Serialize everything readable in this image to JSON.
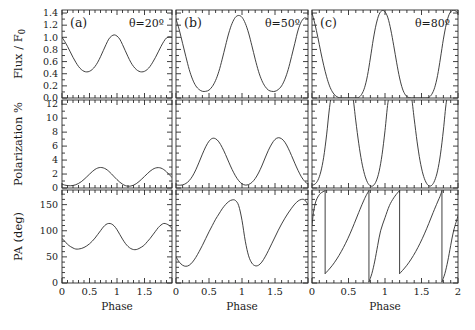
{
  "figure": {
    "panel_labels": [
      "(a)",
      "(b)",
      "(c)"
    ],
    "annotations": [
      "θ=20º",
      "θ=50º",
      "θ=80º"
    ],
    "row_labels": [
      "Flux / F",
      "Polarization %",
      "PA (deg)"
    ],
    "flux_label_main": "Flux / F",
    "flux_label_sub": "0",
    "polarization_label": "Polarization %",
    "pa_label": "PA (deg)",
    "xlabel": "Phase"
  },
  "axes": {
    "x_ticks": [
      0,
      0.5,
      1,
      1.5,
      2
    ],
    "x_ticklabels_col1": [
      "0",
      "0.5",
      "1",
      "1.5",
      ""
    ],
    "x_ticklabels_col2": [
      "0",
      "0.5",
      "1",
      "1.5",
      ""
    ],
    "x_ticklabels_col3": [
      "0",
      "0.5",
      "1",
      "1.5",
      "2"
    ],
    "xlim": [
      0,
      2
    ],
    "flux_ticks": [
      0.0,
      0.2,
      0.4,
      0.6,
      0.8,
      1.0,
      1.2,
      1.4
    ],
    "flux_ticklabels": [
      "0.0",
      "0.2",
      "0.4",
      "0.6",
      "0.8",
      "1.0",
      "1.2",
      "1.4"
    ],
    "flux_ylim": [
      0.0,
      1.45
    ],
    "pol_ticks": [
      0,
      2,
      4,
      6,
      8,
      10,
      12
    ],
    "pol_ticklabels": [
      "0",
      "2",
      "4",
      "6",
      "8",
      "10",
      "12"
    ],
    "pol_ylim": [
      0,
      12.6
    ],
    "pa_ticks": [
      0,
      50,
      100,
      150
    ],
    "pa_ticklabels": [
      "0",
      "50",
      "100",
      "150"
    ],
    "pa_ylim": [
      0,
      178
    ]
  },
  "chart_data": {
    "type": "line",
    "title": "",
    "xlabel": "Phase",
    "grid": false,
    "legend": "none",
    "panels": [
      {
        "row": "flux",
        "col": 0,
        "label": "(a)",
        "annotation": "θ=20º",
        "ylabel": "Flux / F0",
        "ylim": [
          0.0,
          1.45
        ],
        "xlim": [
          0,
          2
        ],
        "x": [
          0.0,
          0.05,
          0.1,
          0.15,
          0.2,
          0.25,
          0.3,
          0.35,
          0.4,
          0.45,
          0.5,
          0.55,
          0.6,
          0.65,
          0.7,
          0.75,
          0.8,
          0.85,
          0.9,
          0.95,
          1.0,
          1.05,
          1.1,
          1.15,
          1.2,
          1.25,
          1.3,
          1.35,
          1.4,
          1.45,
          1.5,
          1.55,
          1.6,
          1.65,
          1.7,
          1.75,
          1.8,
          1.85,
          1.9,
          1.95,
          2.0
        ],
        "y": [
          1.0,
          0.93,
          0.85,
          0.76,
          0.67,
          0.59,
          0.52,
          0.47,
          0.44,
          0.43,
          0.44,
          0.47,
          0.52,
          0.59,
          0.68,
          0.78,
          0.88,
          0.97,
          1.02,
          1.04,
          1.02,
          0.97,
          0.88,
          0.78,
          0.68,
          0.59,
          0.52,
          0.47,
          0.44,
          0.43,
          0.44,
          0.47,
          0.52,
          0.59,
          0.67,
          0.76,
          0.85,
          0.93,
          0.99,
          1.01,
          1.0
        ]
      },
      {
        "row": "flux",
        "col": 1,
        "label": "(b)",
        "annotation": "θ=50º",
        "ylabel": "Flux / F0",
        "ylim": [
          0.0,
          1.45
        ],
        "xlim": [
          0,
          2
        ],
        "x": [
          0.0,
          0.05,
          0.1,
          0.15,
          0.2,
          0.25,
          0.3,
          0.35,
          0.4,
          0.45,
          0.5,
          0.55,
          0.6,
          0.65,
          0.7,
          0.75,
          0.8,
          0.85,
          0.9,
          0.95,
          1.0,
          1.05,
          1.1,
          1.15,
          1.2,
          1.25,
          1.3,
          1.35,
          1.4,
          1.45,
          1.5,
          1.55,
          1.6,
          1.65,
          1.7,
          1.75,
          1.8,
          1.85,
          1.9,
          1.95,
          2.0
        ],
        "y": [
          1.3,
          1.12,
          0.9,
          0.68,
          0.47,
          0.31,
          0.2,
          0.14,
          0.11,
          0.11,
          0.13,
          0.19,
          0.29,
          0.44,
          0.64,
          0.86,
          1.07,
          1.23,
          1.33,
          1.36,
          1.33,
          1.23,
          1.07,
          0.86,
          0.64,
          0.44,
          0.29,
          0.19,
          0.13,
          0.11,
          0.11,
          0.14,
          0.2,
          0.31,
          0.47,
          0.68,
          0.9,
          1.12,
          1.26,
          1.32,
          1.3
        ]
      },
      {
        "row": "flux",
        "col": 2,
        "label": "(c)",
        "annotation": "θ=80º",
        "ylabel": "Flux / F0",
        "ylim": [
          0.0,
          1.45
        ],
        "xlim": [
          0,
          2
        ],
        "x": [
          0.0,
          0.04,
          0.08,
          0.12,
          0.16,
          0.2,
          0.24,
          0.28,
          0.32,
          0.36,
          0.4,
          0.44,
          0.48,
          0.52,
          0.56,
          0.6,
          0.64,
          0.68,
          0.72,
          0.76,
          0.8,
          0.84,
          0.88,
          0.92,
          0.96,
          1.0,
          1.04,
          1.08,
          1.12,
          1.16,
          1.2,
          1.24,
          1.28,
          1.32,
          1.36,
          1.4,
          1.44,
          1.48,
          1.52,
          1.56,
          1.6,
          1.64,
          1.68,
          1.72,
          1.76,
          1.8,
          1.84,
          1.88,
          1.92,
          1.96,
          2.0
        ],
        "y": [
          1.4,
          1.22,
          1.0,
          0.76,
          0.54,
          0.35,
          0.2,
          0.1,
          0.04,
          0.01,
          0.0,
          0.0,
          0.0,
          0.0,
          0.0,
          0.0,
          0.01,
          0.06,
          0.17,
          0.37,
          0.66,
          0.97,
          1.22,
          1.38,
          1.44,
          1.42,
          1.32,
          1.12,
          0.86,
          0.58,
          0.33,
          0.15,
          0.05,
          0.01,
          0.0,
          0.0,
          0.0,
          0.0,
          0.0,
          0.0,
          0.01,
          0.06,
          0.17,
          0.37,
          0.66,
          0.97,
          1.22,
          1.38,
          1.44,
          1.44,
          1.4
        ]
      },
      {
        "row": "polarization",
        "col": 0,
        "label": "",
        "annotation": "",
        "ylabel": "Polarization %",
        "ylim": [
          0,
          12.6
        ],
        "xlim": [
          0,
          2
        ],
        "x": [
          0.0,
          0.05,
          0.1,
          0.15,
          0.2,
          0.25,
          0.3,
          0.35,
          0.4,
          0.45,
          0.5,
          0.55,
          0.6,
          0.65,
          0.7,
          0.75,
          0.8,
          0.85,
          0.9,
          0.95,
          1.0,
          1.05,
          1.1,
          1.15,
          1.2,
          1.25,
          1.3,
          1.35,
          1.4,
          1.45,
          1.5,
          1.55,
          1.6,
          1.65,
          1.7,
          1.75,
          1.8,
          1.85,
          1.9,
          1.95,
          2.0
        ],
        "y": [
          0.55,
          0.42,
          0.34,
          0.32,
          0.36,
          0.47,
          0.65,
          0.9,
          1.23,
          1.6,
          1.98,
          2.35,
          2.66,
          2.86,
          2.94,
          2.88,
          2.7,
          2.4,
          2.02,
          1.6,
          1.2,
          0.84,
          0.55,
          0.35,
          0.26,
          0.28,
          0.4,
          0.62,
          0.92,
          1.28,
          1.66,
          2.04,
          2.4,
          2.68,
          2.86,
          2.92,
          2.85,
          2.64,
          2.32,
          1.92,
          1.5
        ]
      },
      {
        "row": "polarization",
        "col": 1,
        "label": "",
        "annotation": "",
        "ylabel": "Polarization %",
        "ylim": [
          0,
          12.6
        ],
        "xlim": [
          0,
          2
        ],
        "x": [
          0.0,
          0.05,
          0.1,
          0.15,
          0.2,
          0.25,
          0.3,
          0.35,
          0.4,
          0.45,
          0.5,
          0.55,
          0.6,
          0.65,
          0.7,
          0.75,
          0.8,
          0.85,
          0.9,
          0.95,
          1.0,
          1.05,
          1.1,
          1.15,
          1.2,
          1.25,
          1.3,
          1.35,
          1.4,
          1.45,
          1.5,
          1.55,
          1.6,
          1.65,
          1.7,
          1.75,
          1.8,
          1.85,
          1.9,
          1.95,
          2.0
        ],
        "y": [
          0.45,
          0.4,
          0.45,
          0.65,
          1.05,
          1.7,
          2.6,
          3.7,
          4.85,
          5.9,
          6.7,
          7.1,
          7.05,
          6.6,
          5.8,
          4.8,
          3.7,
          2.65,
          1.75,
          1.05,
          0.6,
          0.42,
          0.5,
          0.8,
          1.35,
          2.15,
          3.15,
          4.3,
          5.4,
          6.3,
          6.95,
          7.2,
          7.05,
          6.55,
          5.7,
          4.65,
          3.55,
          2.5,
          1.6,
          0.95,
          0.55
        ]
      },
      {
        "row": "polarization",
        "col": 2,
        "label": "",
        "annotation": "",
        "ylabel": "Polarization %",
        "ylim": [
          0,
          12.6
        ],
        "xlim": [
          0,
          2
        ],
        "note": "off-scale: exceeds 12% near phases 0.0, 0.5-0.6, 1.1, 1.6",
        "x": [
          0.0,
          0.04,
          0.08,
          0.12,
          0.16,
          0.2,
          0.24,
          0.28,
          0.32,
          0.36,
          0.4,
          0.44,
          0.48,
          0.52,
          0.56,
          0.6,
          0.64,
          0.68,
          0.72,
          0.76,
          0.8,
          0.84,
          0.88,
          0.92,
          0.96,
          1.0,
          1.04,
          1.08,
          1.12,
          1.16,
          1.2,
          1.24,
          1.28,
          1.32,
          1.36,
          1.4,
          1.44,
          1.48,
          1.52,
          1.56,
          1.6,
          1.64,
          1.68,
          1.72,
          1.76,
          1.8,
          1.84,
          1.88,
          1.92,
          1.96,
          2.0
        ],
        "y": [
          0.4,
          0.55,
          1.1,
          2.3,
          4.4,
          7.6,
          11.5,
          14.0,
          14.0,
          14.0,
          14.0,
          14.0,
          14.0,
          14.0,
          13.0,
          9.6,
          6.4,
          3.8,
          1.95,
          0.8,
          0.3,
          0.35,
          1.0,
          2.4,
          4.8,
          8.2,
          12.2,
          14.0,
          14.0,
          14.0,
          14.0,
          14.0,
          14.0,
          14.0,
          13.2,
          9.9,
          6.6,
          3.9,
          2.0,
          0.85,
          0.32,
          0.38,
          1.05,
          2.45,
          4.85,
          8.3,
          12.3,
          14.0,
          14.0,
          14.0,
          14.0
        ]
      },
      {
        "row": "pa",
        "col": 0,
        "label": "",
        "annotation": "",
        "ylabel": "PA (deg)",
        "ylim": [
          0,
          178
        ],
        "xlim": [
          0,
          2
        ],
        "x": [
          0.0,
          0.05,
          0.1,
          0.15,
          0.2,
          0.25,
          0.3,
          0.35,
          0.4,
          0.45,
          0.5,
          0.55,
          0.6,
          0.65,
          0.7,
          0.75,
          0.8,
          0.85,
          0.9,
          0.95,
          1.0,
          1.05,
          1.1,
          1.15,
          1.2,
          1.25,
          1.3,
          1.35,
          1.4,
          1.45,
          1.5,
          1.55,
          1.6,
          1.65,
          1.7,
          1.75,
          1.8,
          1.85,
          1.9,
          1.95,
          2.0
        ],
        "y": [
          85,
          80,
          74,
          70,
          67,
          65,
          65,
          66,
          68,
          71,
          75,
          80,
          86,
          93,
          100,
          107,
          112,
          114,
          113,
          109,
          102,
          93,
          84,
          76,
          70,
          66,
          64,
          64,
          66,
          69,
          73,
          79,
          85,
          92,
          99,
          106,
          111,
          114,
          113,
          110,
          104
        ]
      },
      {
        "row": "pa",
        "col": 1,
        "label": "",
        "annotation": "",
        "ylabel": "PA (deg)",
        "ylim": [
          0,
          178
        ],
        "xlim": [
          0,
          2
        ],
        "x": [
          0.0,
          0.05,
          0.1,
          0.15,
          0.2,
          0.25,
          0.3,
          0.35,
          0.4,
          0.45,
          0.5,
          0.55,
          0.6,
          0.65,
          0.7,
          0.75,
          0.8,
          0.85,
          0.9,
          0.95,
          1.0,
          1.05,
          1.1,
          1.15,
          1.2,
          1.25,
          1.3,
          1.35,
          1.4,
          1.45,
          1.5,
          1.55,
          1.6,
          1.65,
          1.7,
          1.75,
          1.8,
          1.85,
          1.9,
          1.95,
          2.0
        ],
        "y": [
          50,
          40,
          34,
          32,
          34,
          40,
          49,
          60,
          72,
          85,
          98,
          110,
          122,
          132,
          142,
          150,
          156,
          159,
          158,
          148,
          120,
          80,
          52,
          38,
          33,
          34,
          40,
          50,
          62,
          75,
          88,
          101,
          113,
          124,
          134,
          143,
          151,
          157,
          160,
          159,
          150
        ]
      },
      {
        "row": "pa",
        "col": 2,
        "label": "",
        "annotation": "",
        "ylabel": "PA (deg)",
        "ylim": [
          0,
          178
        ],
        "xlim": [
          0,
          2
        ],
        "note": "branches with 180-degree wrap discontinuities at phase 0.18, 0.78, 1.2, 1.78",
        "branches": [
          {
            "x": [
              0.0,
              0.02,
              0.05,
              0.09,
              0.13,
              0.17,
              0.18
            ],
            "y": [
              110,
              135,
              155,
              167,
              173,
              176,
              177
            ]
          },
          {
            "x": [
              0.18,
              0.22,
              0.28,
              0.34,
              0.4,
              0.46,
              0.52,
              0.58,
              0.64,
              0.7,
              0.74,
              0.78
            ],
            "y": [
              18,
              24,
              34,
              46,
              60,
              76,
              94,
              114,
              135,
              155,
              167,
              177
            ]
          },
          {
            "x": [
              0.78,
              0.82,
              0.86,
              0.9,
              0.94,
              1.0,
              1.06,
              1.12,
              1.18,
              1.2
            ],
            "y": [
              2,
              18,
              42,
              72,
              100,
              125,
              148,
              163,
              174,
              177
            ]
          },
          {
            "x": [
              1.2,
              1.24,
              1.3,
              1.36,
              1.42,
              1.48,
              1.54,
              1.6,
              1.66,
              1.72,
              1.76,
              1.78
            ],
            "y": [
              18,
              24,
              34,
              46,
              60,
              76,
              94,
              114,
              135,
              155,
              168,
              177
            ]
          },
          {
            "x": [
              1.78,
              1.82,
              1.86,
              1.9,
              1.94,
              2.0
            ],
            "y": [
              2,
              18,
              42,
              72,
              100,
              128
            ]
          }
        ]
      }
    ]
  }
}
